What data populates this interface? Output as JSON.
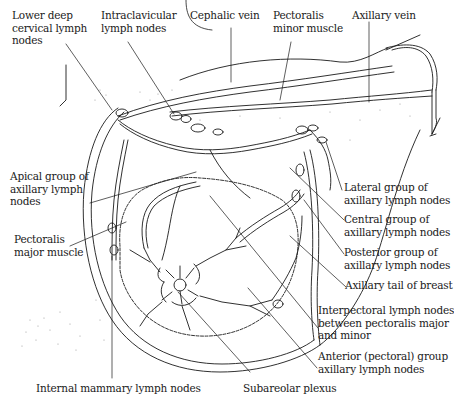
{
  "figure": {
    "colors": {
      "line": "#1a1a1a",
      "stipple": "#9a9a9a",
      "background": "#ffffff"
    }
  },
  "labels": {
    "lower_deep_cervical": "Lower deep\ncervical lymph\nnodes",
    "intraclavicular": "Intraclavicular\nlymph nodes",
    "cephalic_vein": "Cephalic vein",
    "pectoralis_minor": "Pectoralis\nminor muscle",
    "axillary_vein": "Axillary vein",
    "apical_group": "Apical group of\naxillary lymph\nnodes",
    "pectoralis_major": "Pectoralis\nmajor muscle",
    "lateral_group": "Lateral group of\naxillary lymph nodes",
    "central_group": "Central group of\naxillary lymph nodes",
    "posterior_group": "Posterior group of\naxillary lymph nodes",
    "axillary_tail": "Axillary tail of breast",
    "interpectoral": "Interpectoral lymph nodes\nbetween pectoralis major\nand minor",
    "anterior_group": "Anterior (pectoral) group\naxillary lymph nodes",
    "internal_mammary": "Internal mammary lymph nodes",
    "subareolar_plexus": "Subareolar plexus"
  }
}
